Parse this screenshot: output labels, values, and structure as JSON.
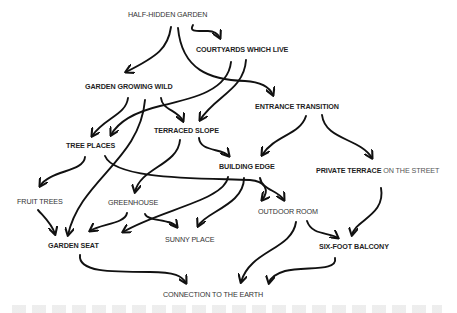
{
  "diagram": {
    "type": "pattern-language-network",
    "nodes": [
      {
        "id": "half_hidden_garden",
        "label": "HALF-HIDDEN GARDEN",
        "x": 128,
        "y": 11
      },
      {
        "id": "courtyards_which_live",
        "label": "COURTYARDS WHICH LIVE",
        "x": 196,
        "y": 46
      },
      {
        "id": "garden_growing_wild",
        "label": "GARDEN GROWING WILD",
        "x": 85,
        "y": 83
      },
      {
        "id": "entrance_transition",
        "label": "ENTRANCE TRANSITION",
        "x": 255,
        "y": 103
      },
      {
        "id": "terraced_slope",
        "label": "TERRACED SLOPE",
        "x": 154,
        "y": 127
      },
      {
        "id": "tree_places",
        "label": "TREE PLACES",
        "x": 66,
        "y": 142
      },
      {
        "id": "building_edge",
        "label": "BUILDING EDGE",
        "x": 219,
        "y": 163
      },
      {
        "id": "private_terrace",
        "label": "PRIVATE TERRACE",
        "label_suffix": "ON THE STREET",
        "x": 316,
        "y": 167
      },
      {
        "id": "fruit_trees",
        "label": "FRUIT TREES",
        "x": 17,
        "y": 198
      },
      {
        "id": "greenhouse",
        "label": "GREENHOUSE",
        "x": 108,
        "y": 199
      },
      {
        "id": "outdoor_room",
        "label": "OUTDOOR ROOM",
        "x": 258,
        "y": 208
      },
      {
        "id": "sunny_place",
        "label": "SUNNY PLACE",
        "x": 165,
        "y": 236
      },
      {
        "id": "garden_seat",
        "label": "GARDEN SEAT",
        "x": 48,
        "y": 242
      },
      {
        "id": "six_foot_balcony",
        "label": "SIX-FOOT BALCONY",
        "x": 319,
        "y": 243
      },
      {
        "id": "connection_to_earth",
        "label": "CONNECTION TO THE EARTH",
        "x": 163,
        "y": 291
      }
    ],
    "edges": [
      {
        "from": "half_hidden_garden",
        "to": "courtyards_which_live"
      },
      {
        "from": "half_hidden_garden",
        "to": "garden_growing_wild"
      },
      {
        "from": "half_hidden_garden",
        "to": "entrance_transition"
      },
      {
        "from": "courtyards_which_live",
        "to": "tree_places"
      },
      {
        "from": "courtyards_which_live",
        "to": "terraced_slope"
      },
      {
        "from": "garden_growing_wild",
        "to": "tree_places"
      },
      {
        "from": "garden_growing_wild",
        "to": "terraced_slope"
      },
      {
        "from": "garden_growing_wild",
        "to": "garden_seat"
      },
      {
        "from": "entrance_transition",
        "to": "building_edge"
      },
      {
        "from": "entrance_transition",
        "to": "private_terrace"
      },
      {
        "from": "terraced_slope",
        "to": "building_edge"
      },
      {
        "from": "terraced_slope",
        "to": "greenhouse"
      },
      {
        "from": "tree_places",
        "to": "fruit_trees"
      },
      {
        "from": "tree_places",
        "to": "outdoor_room"
      },
      {
        "from": "building_edge",
        "to": "outdoor_room"
      },
      {
        "from": "building_edge",
        "to": "garden_seat"
      },
      {
        "from": "building_edge",
        "to": "sunny_place"
      },
      {
        "from": "private_terrace",
        "to": "six_foot_balcony"
      },
      {
        "from": "fruit_trees",
        "to": "garden_seat"
      },
      {
        "from": "greenhouse",
        "to": "garden_seat"
      },
      {
        "from": "greenhouse",
        "to": "sunny_place"
      },
      {
        "from": "outdoor_room",
        "to": "six_foot_balcony"
      },
      {
        "from": "outdoor_room",
        "to": "connection_to_earth"
      },
      {
        "from": "garden_seat",
        "to": "connection_to_earth"
      },
      {
        "from": "six_foot_balcony",
        "to": "connection_to_earth"
      }
    ]
  },
  "style": {
    "background": "#ffffff",
    "stroke": "#111111",
    "text": "#333333"
  }
}
